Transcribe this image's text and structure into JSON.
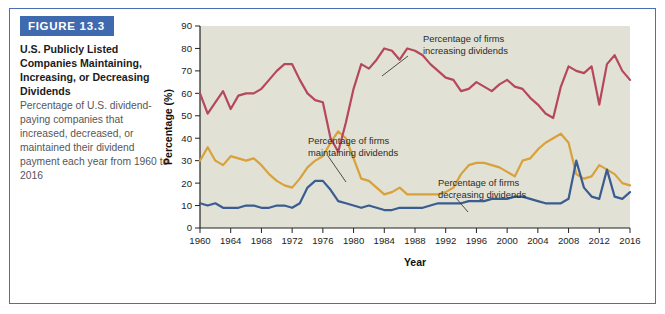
{
  "figure": {
    "banner_label": "FIGURE 13.3",
    "title": "U.S. Publicly Listed Companies Maintaining, Increasing, or Decreasing Dividends",
    "body": "Percentage of U.S. dividend-paying companies that increased, decreased, or maintained their dividend payment each year from 1960 to 2016"
  },
  "colors": {
    "banner": "#3f6ab0",
    "frame_border": "#4a6fb5",
    "plot_background": "#e1e1d5",
    "increasing": "#b5485a",
    "maintaining": "#d9a13a",
    "decreasing": "#3a5c90"
  },
  "annotations": [
    {
      "id": "increasing",
      "text_line1": "Percentage of firms",
      "text_line2": "increasing dividends"
    },
    {
      "id": "maintaining",
      "text_line1": "Percentage of firms",
      "text_line2": "maintaining dividends"
    },
    {
      "id": "decreasing",
      "text_line1": "Percentage of firms",
      "text_line2": "decreasing dividends"
    }
  ],
  "chart_data": {
    "type": "line",
    "title": "U.S. Publicly Listed Companies Maintaining, Increasing, or Decreasing Dividends",
    "xlabel": "Year",
    "ylabel": "Percentage (%)",
    "xlim": [
      1960,
      2016
    ],
    "ylim": [
      0,
      90
    ],
    "ytick_step": 10,
    "yticks": [
      0,
      10,
      20,
      30,
      40,
      50,
      60,
      70,
      80,
      90
    ],
    "xticks": [
      1960,
      1964,
      1968,
      1972,
      1976,
      1980,
      1984,
      1988,
      1992,
      1996,
      2000,
      2004,
      2008,
      2012,
      2016
    ],
    "grid": false,
    "legend_position": "inline-annotations",
    "x": [
      1960,
      1961,
      1962,
      1963,
      1964,
      1965,
      1966,
      1967,
      1968,
      1969,
      1970,
      1971,
      1972,
      1973,
      1974,
      1975,
      1976,
      1977,
      1978,
      1979,
      1980,
      1981,
      1982,
      1983,
      1984,
      1985,
      1986,
      1987,
      1988,
      1989,
      1990,
      1991,
      1992,
      1993,
      1994,
      1995,
      1996,
      1997,
      1998,
      1999,
      2000,
      2001,
      2002,
      2003,
      2004,
      2005,
      2006,
      2007,
      2008,
      2009,
      2010,
      2011,
      2012,
      2013,
      2014,
      2015,
      2016
    ],
    "series": [
      {
        "name": "Percentage of firms increasing dividends",
        "color": "#b5485a",
        "values": [
          60,
          51,
          56,
          61,
          53,
          59,
          62,
          65,
          68,
          71,
          73,
          73,
          68,
          59,
          52,
          46,
          41,
          38,
          37,
          36,
          35,
          37,
          40,
          44,
          46,
          48,
          50,
          52,
          54,
          56,
          58,
          60,
          62,
          64,
          66,
          68,
          70,
          72,
          73,
          74,
          72,
          70,
          66,
          62,
          60,
          58,
          56,
          54,
          52,
          50,
          48,
          46,
          44,
          42,
          41,
          40,
          39
        ]
      },
      {
        "name": "Percentage of firms maintaining dividends",
        "color": "#d9a13a",
        "values": [
          30,
          36,
          30,
          28,
          32,
          31,
          28,
          26,
          24,
          22,
          19,
          18,
          22,
          28,
          30,
          33,
          36,
          38,
          40,
          41,
          42,
          40,
          38,
          36,
          34,
          32,
          30,
          28,
          26,
          24,
          22,
          21,
          20,
          19,
          18,
          17,
          16,
          15,
          14,
          13,
          12,
          11,
          10,
          9,
          8,
          7,
          6,
          5,
          4,
          3,
          2,
          1,
          1,
          1,
          1,
          1,
          1
        ]
      },
      {
        "name": "Percentage of firms decreasing dividends",
        "color": "#3a5c90",
        "values": [
          11,
          10,
          11,
          10,
          9,
          9,
          10,
          10,
          9,
          9,
          10,
          10,
          10,
          13,
          21,
          21,
          16,
          12,
          10,
          9,
          9,
          10,
          11,
          12,
          13,
          14,
          15,
          16,
          17,
          18,
          19,
          20,
          21,
          22,
          23,
          24,
          25,
          26,
          27,
          28,
          29,
          30,
          31,
          32,
          33,
          34,
          35,
          36,
          37,
          38,
          39,
          40,
          41,
          42,
          43,
          44,
          45
        ]
      }
    ],
    "series_points": {
      "increasing": [
        [
          1960,
          60
        ],
        [
          1961,
          51
        ],
        [
          1962,
          56
        ],
        [
          1963,
          61
        ],
        [
          1964,
          53
        ],
        [
          1965,
          59
        ],
        [
          1966,
          60
        ],
        [
          1967,
          60
        ],
        [
          1968,
          62
        ],
        [
          1969,
          66
        ],
        [
          1970,
          70
        ],
        [
          1971,
          73
        ],
        [
          1972,
          73
        ],
        [
          1973,
          66
        ],
        [
          1974,
          60
        ],
        [
          1975,
          57
        ],
        [
          1976,
          56
        ],
        [
          1977,
          40
        ],
        [
          1978,
          34
        ],
        [
          1979,
          47
        ],
        [
          1980,
          62
        ],
        [
          1981,
          73
        ],
        [
          1982,
          71
        ],
        [
          1983,
          75
        ],
        [
          1984,
          80
        ],
        [
          1985,
          79
        ],
        [
          1986,
          75
        ],
        [
          1987,
          80
        ],
        [
          1988,
          79
        ],
        [
          1989,
          77
        ],
        [
          1990,
          73
        ],
        [
          1991,
          70
        ],
        [
          1992,
          67
        ],
        [
          1993,
          66
        ],
        [
          1994,
          61
        ],
        [
          1995,
          62
        ],
        [
          1996,
          65
        ],
        [
          1997,
          63
        ],
        [
          1998,
          61
        ],
        [
          1999,
          64
        ],
        [
          2000,
          66
        ],
        [
          2001,
          63
        ],
        [
          2002,
          62
        ],
        [
          2003,
          58
        ],
        [
          2004,
          55
        ],
        [
          2005,
          51
        ],
        [
          2006,
          49
        ],
        [
          2007,
          63
        ],
        [
          2008,
          72
        ],
        [
          2009,
          70
        ],
        [
          2010,
          69
        ],
        [
          2011,
          72
        ],
        [
          2012,
          55
        ],
        [
          2013,
          73
        ],
        [
          2014,
          77
        ],
        [
          2015,
          70
        ],
        [
          2016,
          66
        ]
      ],
      "maintaining": [
        [
          1960,
          30
        ],
        [
          1961,
          36
        ],
        [
          1962,
          30
        ],
        [
          1963,
          28
        ],
        [
          1964,
          32
        ],
        [
          1965,
          31
        ],
        [
          1966,
          30
        ],
        [
          1967,
          31
        ],
        [
          1968,
          28
        ],
        [
          1969,
          24
        ],
        [
          1970,
          21
        ],
        [
          1971,
          19
        ],
        [
          1972,
          18
        ],
        [
          1973,
          22
        ],
        [
          1974,
          27
        ],
        [
          1975,
          30
        ],
        [
          1976,
          32
        ],
        [
          1977,
          38
        ],
        [
          1978,
          43
        ],
        [
          1979,
          40
        ],
        [
          1980,
          31
        ],
        [
          1981,
          22
        ],
        [
          1982,
          21
        ],
        [
          1983,
          18
        ],
        [
          1984,
          15
        ],
        [
          1985,
          16
        ],
        [
          1986,
          18
        ],
        [
          1987,
          15
        ],
        [
          1988,
          15
        ],
        [
          1989,
          15
        ],
        [
          1990,
          15
        ],
        [
          1991,
          15
        ],
        [
          1992,
          16
        ],
        [
          1993,
          18
        ],
        [
          1994,
          24
        ],
        [
          1995,
          28
        ],
        [
          1996,
          29
        ],
        [
          1997,
          29
        ],
        [
          1998,
          28
        ],
        [
          1999,
          27
        ],
        [
          2000,
          25
        ],
        [
          2001,
          23
        ],
        [
          2002,
          30
        ],
        [
          2003,
          31
        ],
        [
          2004,
          35
        ],
        [
          2005,
          38
        ],
        [
          2006,
          40
        ],
        [
          2007,
          42
        ],
        [
          2008,
          38
        ],
        [
          2009,
          24
        ],
        [
          2010,
          22
        ],
        [
          2011,
          23
        ],
        [
          2012,
          28
        ],
        [
          2013,
          26
        ],
        [
          2014,
          24
        ],
        [
          2015,
          20
        ],
        [
          2016,
          19
        ]
      ],
      "decreasing": [
        [
          1960,
          11
        ],
        [
          1961,
          10
        ],
        [
          1962,
          11
        ],
        [
          1963,
          9
        ],
        [
          1964,
          9
        ],
        [
          1965,
          9
        ],
        [
          1966,
          10
        ],
        [
          1967,
          10
        ],
        [
          1968,
          9
        ],
        [
          1969,
          9
        ],
        [
          1970,
          10
        ],
        [
          1971,
          10
        ],
        [
          1972,
          9
        ],
        [
          1973,
          11
        ],
        [
          1974,
          18
        ],
        [
          1975,
          21
        ],
        [
          1976,
          21
        ],
        [
          1977,
          17
        ],
        [
          1978,
          12
        ],
        [
          1979,
          11
        ],
        [
          1980,
          10
        ],
        [
          1981,
          9
        ],
        [
          1982,
          10
        ],
        [
          1983,
          9
        ],
        [
          1984,
          8
        ],
        [
          1985,
          8
        ],
        [
          1986,
          9
        ],
        [
          1987,
          9
        ],
        [
          1988,
          9
        ],
        [
          1989,
          9
        ],
        [
          1990,
          10
        ],
        [
          1991,
          11
        ],
        [
          1992,
          11
        ],
        [
          1993,
          11
        ],
        [
          1994,
          11
        ],
        [
          1995,
          12
        ],
        [
          1996,
          12
        ],
        [
          1997,
          12
        ],
        [
          1998,
          13
        ],
        [
          1999,
          13
        ],
        [
          2000,
          13
        ],
        [
          2001,
          14
        ],
        [
          2002,
          14
        ],
        [
          2003,
          13
        ],
        [
          2004,
          12
        ],
        [
          2005,
          11
        ],
        [
          2006,
          11
        ],
        [
          2007,
          11
        ],
        [
          2008,
          13
        ],
        [
          2009,
          30
        ],
        [
          2010,
          18
        ],
        [
          2011,
          14
        ],
        [
          2012,
          13
        ],
        [
          2013,
          26
        ],
        [
          2014,
          14
        ],
        [
          2015,
          13
        ],
        [
          2016,
          16
        ]
      ]
    }
  }
}
